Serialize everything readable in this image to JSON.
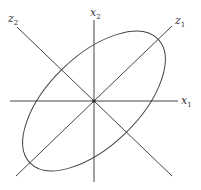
{
  "diagram": {
    "labels": {
      "x1": {
        "base": "x",
        "sub": "1"
      },
      "x2": {
        "base": "x",
        "sub": "2"
      },
      "z1": {
        "base": "z",
        "sub": "1"
      },
      "z2": {
        "base": "z",
        "sub": "2"
      }
    },
    "origin": {
      "x": 94,
      "y": 101
    },
    "ellipse": {
      "rx": 89,
      "ry": 45,
      "rotation_deg": -44
    },
    "colors": {
      "stroke": "#444444",
      "text": "#333333",
      "background": "#ffffff"
    }
  }
}
